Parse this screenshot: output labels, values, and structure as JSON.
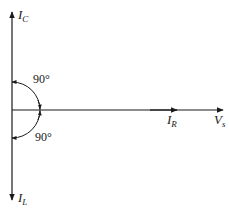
{
  "diagram": {
    "type": "phasor-diagram",
    "colors": {
      "line": "#1a1a1a",
      "background": "#ffffff"
    },
    "origin": {
      "x": 12,
      "y": 110
    },
    "phasors": [
      {
        "id": "ic",
        "label_main": "I",
        "label_sub": "C",
        "direction": "up"
      },
      {
        "id": "il",
        "label_main": "I",
        "label_sub": "L",
        "direction": "down"
      },
      {
        "id": "ir",
        "label_main": "I",
        "label_sub": "R",
        "direction": "right"
      },
      {
        "id": "vs",
        "label_main": "V",
        "label_sub": "s",
        "direction": "right"
      }
    ],
    "angles": [
      {
        "id": "upper",
        "label": "90°",
        "from": "V_s",
        "to": "I_C"
      },
      {
        "id": "lower",
        "label": "90°",
        "from": "V_s",
        "to": "I_L"
      }
    ]
  }
}
